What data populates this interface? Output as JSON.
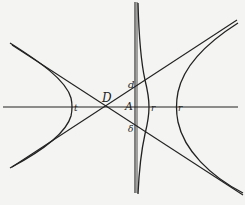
{
  "diagram": {
    "type": "geometric-figure",
    "labels": {
      "D": "D",
      "A": "A",
      "d": "d",
      "delta": "δ",
      "t": "t",
      "r_inner": "r",
      "r_outer": "r"
    },
    "colors": {
      "ink": "#222222",
      "paper": "#f4f4f2"
    }
  }
}
